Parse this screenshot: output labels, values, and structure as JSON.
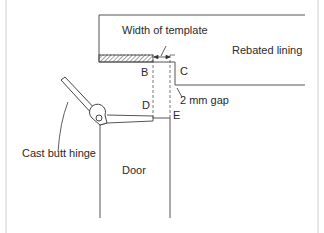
{
  "diagram": {
    "labels": {
      "width_of_template": "Width of template",
      "rebated_lining": "Rebated lining",
      "gap": "2 mm gap",
      "cast_butt_hinge": "Cast butt hinge",
      "door": "Door",
      "point_b": "B",
      "point_c": "C",
      "point_d": "D",
      "point_e": "E"
    },
    "colors": {
      "line": "#555555",
      "text": "#2a2a2a",
      "background": "#ffffff",
      "frame": "#cccccc"
    }
  }
}
